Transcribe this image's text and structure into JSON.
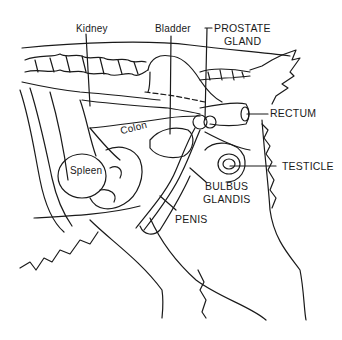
{
  "diagram": {
    "labels": {
      "kidney": "Kidney",
      "bladder": "Bladder",
      "prostate_line1": "PROSTATE",
      "prostate_line2": "GLAND",
      "rectum": "RECTUM",
      "colon": "Colon",
      "spleen": "Spleen",
      "testicle": "TESTICLE",
      "bulbus_line1": "BULBUS",
      "bulbus_line2": "GLANDIS",
      "penis": "PENIS"
    },
    "colors": {
      "line": "#1a1a1a",
      "background": "#ffffff"
    }
  }
}
